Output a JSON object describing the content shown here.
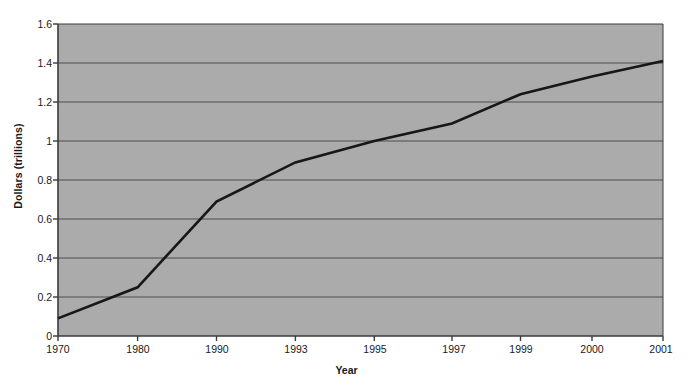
{
  "chart_data": {
    "type": "line",
    "title": "",
    "xlabel": "Year",
    "ylabel": "Dollars (trillions)",
    "categories": [
      "1970",
      "1980",
      "1990",
      "1993",
      "1995",
      "1997",
      "1999",
      "2000",
      "2001"
    ],
    "values": [
      0.09,
      0.25,
      0.69,
      0.89,
      1.0,
      1.09,
      1.24,
      1.33,
      1.41
    ],
    "series": [
      {
        "name": "Dollars (trillions)",
        "values": [
          0.09,
          0.25,
          0.69,
          0.89,
          1.0,
          1.09,
          1.24,
          1.33,
          1.41
        ]
      }
    ],
    "ylim": [
      0,
      1.6
    ],
    "y_ticks": [
      "0",
      "0.2",
      "0.4",
      "0.6",
      "0.8",
      "1",
      "1.2",
      "1.4",
      "1.6"
    ],
    "y_tick_values": [
      0,
      0.2,
      0.4,
      0.6,
      0.8,
      1,
      1.2,
      1.4,
      1.6
    ],
    "grid": "horizontal",
    "legend": "none",
    "colors": {
      "plot_background": "#ababab",
      "page_background": "#ffffff",
      "line": "#171717",
      "gridline": "#4d4d4d",
      "axis": "#3a3a3a",
      "text": "#1a1a1a"
    }
  }
}
